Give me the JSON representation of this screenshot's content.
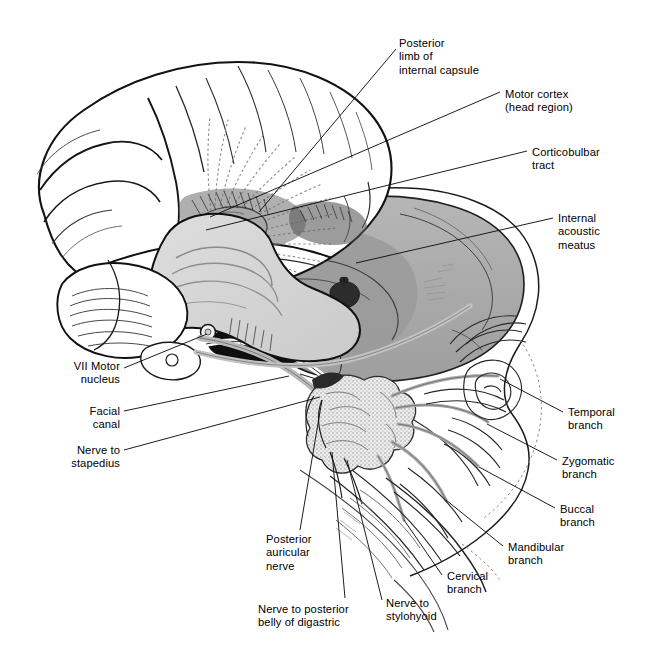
{
  "figure": {
    "background_color": "#ffffff",
    "ink_color": "#000000",
    "brainstem_fill": "#d7d7d7",
    "skull_fill": "#ababab",
    "skull_fill_dark": "#8f8f8f",
    "parotid_fill": "#d9d9d9",
    "nerve_gray": "#b4b4b4",
    "cavity_black": "#161616"
  },
  "labels": [
    {
      "id": "posterior-limb-of-internal-capsule",
      "text": "Posterior\nlimb of\ninternal capsule",
      "align": "left",
      "x": 399,
      "y": 37,
      "leader": {
        "x1": 396,
        "y1": 49,
        "x2": 259,
        "y2": 212
      }
    },
    {
      "id": "motor-cortex-head-region",
      "text": "Motor cortex\n(head region)",
      "align": "left",
      "x": 505,
      "y": 88,
      "leader": {
        "x1": 500,
        "y1": 92,
        "x2": 210,
        "y2": 217
      }
    },
    {
      "id": "corticobulbar-tract",
      "text": "Corticobulbar\ntract",
      "align": "left",
      "x": 532,
      "y": 146,
      "leader": {
        "x1": 527,
        "y1": 151,
        "x2": 206,
        "y2": 230
      }
    },
    {
      "id": "internal-acoustic-meatus",
      "text": "Internal\nacoustic\nmeatus",
      "align": "left",
      "x": 558,
      "y": 212,
      "leader": {
        "x1": 553,
        "y1": 218,
        "x2": 356,
        "y2": 263
      }
    },
    {
      "id": "temporal-branch",
      "text": "Temporal\nbranch",
      "align": "left",
      "x": 568,
      "y": 406,
      "leader": {
        "x1": 563,
        "y1": 412,
        "x2": 500,
        "y2": 379
      }
    },
    {
      "id": "zygomatic-branch",
      "text": "Zygomatic\nbranch",
      "align": "left",
      "x": 562,
      "y": 455,
      "leader": {
        "x1": 557,
        "y1": 460,
        "x2": 487,
        "y2": 424
      }
    },
    {
      "id": "buccal-branch",
      "text": "Buccal\nbranch",
      "align": "left",
      "x": 560,
      "y": 503,
      "leader": {
        "x1": 555,
        "y1": 508,
        "x2": 479,
        "y2": 467
      }
    },
    {
      "id": "mandibular-branch",
      "text": "Mandibular\nbranch",
      "align": "left",
      "x": 508,
      "y": 541,
      "leader": {
        "x1": 503,
        "y1": 546,
        "x2": 446,
        "y2": 500
      }
    },
    {
      "id": "cervical-branch",
      "text": "Cervical\nbranch",
      "align": "left",
      "x": 447,
      "y": 570,
      "leader": {
        "x1": 442,
        "y1": 575,
        "x2": 404,
        "y2": 520
      }
    },
    {
      "id": "nerve-to-stylohyoid",
      "text": "Nerve to\nstylohyoid",
      "align": "left",
      "x": 386,
      "y": 597,
      "leader": {
        "x1": 382,
        "y1": 600,
        "x2": 347,
        "y2": 460
      }
    },
    {
      "id": "nerve-to-posterior-belly-of-digastric",
      "text": "Nerve to posterior\nbelly of digastric",
      "align": "left",
      "x": 258,
      "y": 603,
      "leader": {
        "x1": 345,
        "y1": 598,
        "x2": 332,
        "y2": 452
      }
    },
    {
      "id": "posterior-auricular-nerve",
      "text": "Posterior\nauricular\nnerve",
      "align": "left",
      "x": 266,
      "y": 533,
      "leader": {
        "x1": 300,
        "y1": 530,
        "x2": 322,
        "y2": 400
      }
    },
    {
      "id": "vii-motor-nucleus",
      "text": "VII Motor\nnucleus",
      "align": "right",
      "x": 32,
      "y": 360,
      "width": 88,
      "leader": {
        "x1": 124,
        "y1": 368,
        "x2": 207,
        "y2": 334
      }
    },
    {
      "id": "facial-canal",
      "text": "Facial\ncanal",
      "align": "right",
      "x": 32,
      "y": 405,
      "width": 88,
      "leader": {
        "x1": 124,
        "y1": 411,
        "x2": 289,
        "y2": 376
      }
    },
    {
      "id": "nerve-to-stapedius",
      "text": "Nerve to\nstapedius",
      "align": "right",
      "x": 32,
      "y": 444,
      "width": 88,
      "leader": {
        "x1": 124,
        "y1": 450,
        "x2": 320,
        "y2": 397
      }
    }
  ],
  "structures": [
    {
      "id": "cerebral-hemisphere",
      "name": "Cerebral hemisphere"
    },
    {
      "id": "internal-capsule-fibers",
      "name": "Internal capsule radiating fibers"
    },
    {
      "id": "brainstem",
      "name": "Brainstem / pons / medulla"
    },
    {
      "id": "cerebellum",
      "name": "Cerebellum"
    },
    {
      "id": "skull-cutaway",
      "name": "Skull cutaway (temporal bone)"
    },
    {
      "id": "parotid-gland",
      "name": "Parotid gland"
    },
    {
      "id": "facial-muscles",
      "name": "Facial muscles of expression"
    },
    {
      "id": "mandible",
      "name": "Mandible"
    },
    {
      "id": "neck-platysma",
      "name": "Neck / platysma"
    }
  ]
}
